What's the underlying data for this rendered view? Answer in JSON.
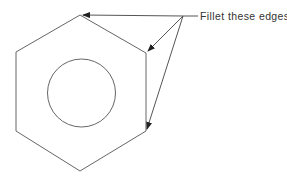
{
  "diagram": {
    "annotation": {
      "text": "Fillet these edges"
    },
    "shapes": {
      "hexagon": "hex-nut-outline",
      "circle": "hole"
    },
    "colors": {
      "stroke": "#555555",
      "text": "#333333",
      "background": "#ffffff"
    }
  }
}
